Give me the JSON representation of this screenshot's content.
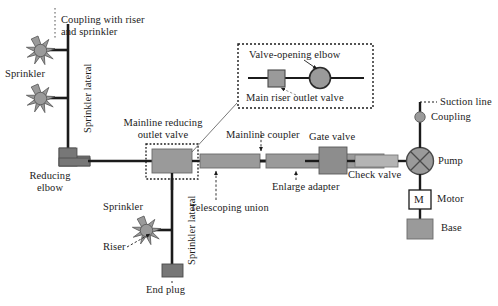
{
  "figure": {
    "background": "#ffffff",
    "line_color": "#1b1b1b",
    "fill_gray_mid": "#9a9a9a",
    "fill_gray_dark": "#777777",
    "fill_gray_light": "#b4b4b4",
    "fill_white": "#ffffff"
  },
  "labels": {
    "coupling_with_riser": "Coupling with riser\nand sprinkler",
    "sprinkler_left": "Sprinkler",
    "sprinkler_lateral_upper": "Sprinkler lateral",
    "reducing_elbow": "Reducing\nelbow",
    "mainline_reducing_outlet_valve": "Mainline reducing\noutlet valve",
    "mainline_coupler": "Mainline coupler",
    "telescoping_union": "Telescoping union",
    "enlarge_adapter": "Enlarge adapter",
    "gate_valve": "Gate valve",
    "check_valve": "Check valve",
    "pump": "Pump",
    "motor": "Motor",
    "motor_symbol": "M",
    "base": "Base",
    "coupling": "Coupling",
    "suction_line": "Suction line",
    "sprinkler_lower": "Sprinkler",
    "sprinkler_lateral_lower": "Sprinkler lateral",
    "riser": "Riser",
    "end_plug": "End plug"
  },
  "inset": {
    "title": "Valve-opening elbow",
    "caption": "Main riser outlet valve"
  },
  "components": {
    "sprinklers_upper": 2,
    "sprinklers_lower": 1,
    "mainline_pipe_segments": 3,
    "mainline_couplers": 2
  }
}
